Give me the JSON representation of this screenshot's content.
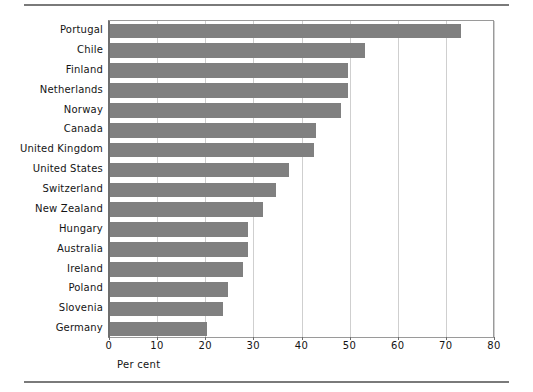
{
  "figure": {
    "axis_title": "Per cent",
    "bar_color": "#808080",
    "grid_color": "#cfcfcf",
    "axis_color": "#6e6e6e",
    "rule_color": "#7a7a7a"
  },
  "chart_data": {
    "type": "bar",
    "orientation": "horizontal",
    "title": "",
    "subtitle": "",
    "xlabel": "Per cent",
    "ylabel": "",
    "xlim": [
      0,
      80
    ],
    "xticks": [
      0,
      10,
      20,
      30,
      40,
      50,
      60,
      70,
      80
    ],
    "xtick_labels": [
      "0",
      "10",
      "20",
      "30",
      "40",
      "50",
      "60",
      "70",
      "80"
    ],
    "grid": "vertical",
    "legend": "none",
    "categories": [
      "Portugal",
      "Chile",
      "Finland",
      "Netherlands",
      "Norway",
      "Canada",
      "United Kingdom",
      "United States",
      "Switzerland",
      "New Zealand",
      "Hungary",
      "Australia",
      "Ireland",
      "Poland",
      "Slovenia",
      "Germany"
    ],
    "values": [
      73.0,
      53.0,
      49.5,
      49.5,
      48.0,
      42.8,
      42.4,
      37.2,
      34.5,
      31.8,
      28.7,
      28.7,
      27.7,
      24.6,
      23.4,
      20.1
    ],
    "series": [
      {
        "name": "Per cent",
        "values": [
          73.0,
          53.0,
          49.5,
          49.5,
          48.0,
          42.8,
          42.4,
          37.2,
          34.5,
          31.8,
          28.7,
          28.7,
          27.7,
          24.6,
          23.4,
          20.1
        ]
      }
    ]
  }
}
